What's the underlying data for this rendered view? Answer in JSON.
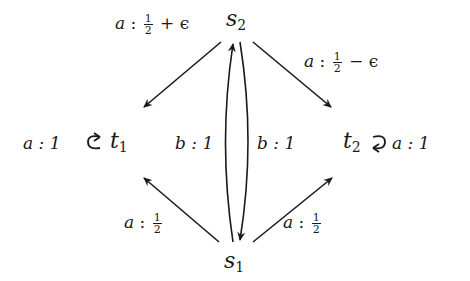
{
  "diagram": {
    "type": "markov-decision-graph",
    "nodes": [
      {
        "id": "s2",
        "name": "s",
        "sub": "2"
      },
      {
        "id": "t1",
        "name": "t",
        "sub": "1"
      },
      {
        "id": "t2",
        "name": "t",
        "sub": "2"
      },
      {
        "id": "s1",
        "name": "s",
        "sub": "1"
      }
    ],
    "edges": [
      {
        "from": "s2",
        "to": "t1",
        "action": "a",
        "sep": " : ",
        "num": "1",
        "den": "2",
        "suffix": " + ϵ"
      },
      {
        "from": "s2",
        "to": "t2",
        "action": "a",
        "sep": " : ",
        "num": "1",
        "den": "2",
        "suffix": " − ϵ"
      },
      {
        "from": "s1",
        "to": "s2",
        "action": "b",
        "label": "b : 1"
      },
      {
        "from": "s2",
        "to": "s1",
        "action": "b",
        "label": "b : 1"
      },
      {
        "from": "s1",
        "to": "t1",
        "action": "a",
        "sep": " : ",
        "num": "1",
        "den": "2"
      },
      {
        "from": "s1",
        "to": "t2",
        "action": "a",
        "sep": " : ",
        "num": "1",
        "den": "2"
      },
      {
        "from": "t1",
        "to": "t1",
        "action": "a",
        "label": "a : 1"
      },
      {
        "from": "t2",
        "to": "t2",
        "action": "a",
        "label": "a : 1"
      }
    ]
  }
}
